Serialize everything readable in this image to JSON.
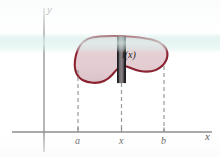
{
  "figure": {
    "axes": {
      "y_label": "y",
      "x_label": "x",
      "x_axis_y": 132,
      "y_axis_x": 44
    },
    "ticks": [
      {
        "label": "a",
        "x": 78
      },
      {
        "label": "x",
        "x": 122
      },
      {
        "label": "b",
        "x": 164
      }
    ],
    "region": {
      "name": "plane-region",
      "fill_color": "#e3cbd0",
      "outline_color": "#8b2230",
      "bounds": {
        "left": 75,
        "right": 167,
        "top": 36,
        "bottom": 83
      }
    },
    "cross_section": {
      "label": "l(x)",
      "x": 122,
      "top": 37,
      "bottom": 83,
      "fill_color": "#5e585a",
      "edge_color": "#1a1a1a"
    },
    "dashed_lines": [
      {
        "name": "dashed-line-a",
        "x": 78,
        "y_top": 70,
        "y_bottom": 132
      },
      {
        "name": "dashed-line-x",
        "x": 122,
        "y_top": 83,
        "y_bottom": 132
      },
      {
        "name": "dashed-line-b",
        "x": 164,
        "y_top": 68,
        "y_bottom": 132
      }
    ],
    "colors": {
      "axis": "#8e8e8e",
      "dashed": "#9a9a9a",
      "blob_fill": "#e3cbd0",
      "blob_outline": "#8b2230",
      "band_tint": "#d9efec"
    }
  }
}
